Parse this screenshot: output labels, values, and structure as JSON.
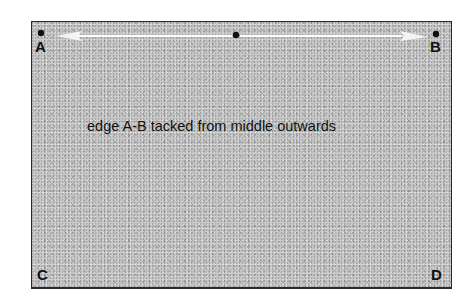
{
  "diagram": {
    "caption": "edge A-B tacked from middle outwards",
    "corners": {
      "a": "A",
      "b": "B",
      "c": "C",
      "d": "D"
    },
    "colors": {
      "fabric": "#c9c9c9",
      "border": "#2a2a2a",
      "arrow": "#ffffff",
      "dot": "#111111"
    }
  }
}
